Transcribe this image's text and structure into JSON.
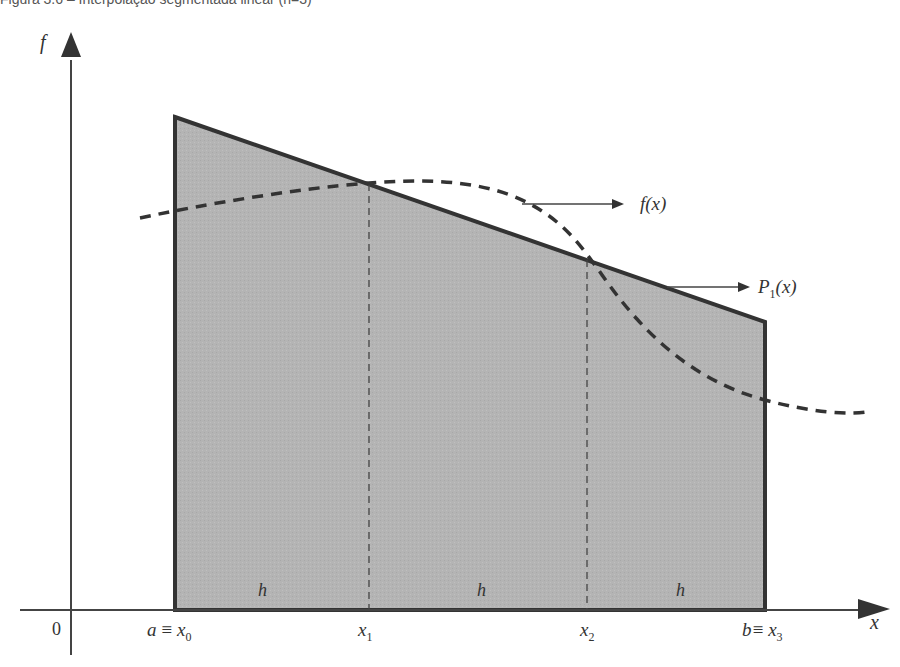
{
  "figure": {
    "caption_partial": "Figura 3.6 – Interpolação segmentada linear (n=3)",
    "axes": {
      "y_label": "f",
      "x_label": "x",
      "origin_label": "0"
    },
    "nodes": [
      {
        "label_main": "a ≡ x",
        "sub": "0",
        "x": 175
      },
      {
        "label_main": "x",
        "sub": "1",
        "x": 369
      },
      {
        "label_main": "x",
        "sub": "2",
        "x": 587
      },
      {
        "label_main": "b≡ x",
        "sub": "3",
        "x": 765
      }
    ],
    "step_labels": [
      "h",
      "h",
      "h"
    ],
    "curve_label": "f(x)",
    "poly_label_main": "P",
    "poly_label_sub": "1",
    "poly_label_tail": "(x)",
    "colors": {
      "fill": "#b3b3b3",
      "stroke": "#333333",
      "axis": "#444444"
    }
  }
}
